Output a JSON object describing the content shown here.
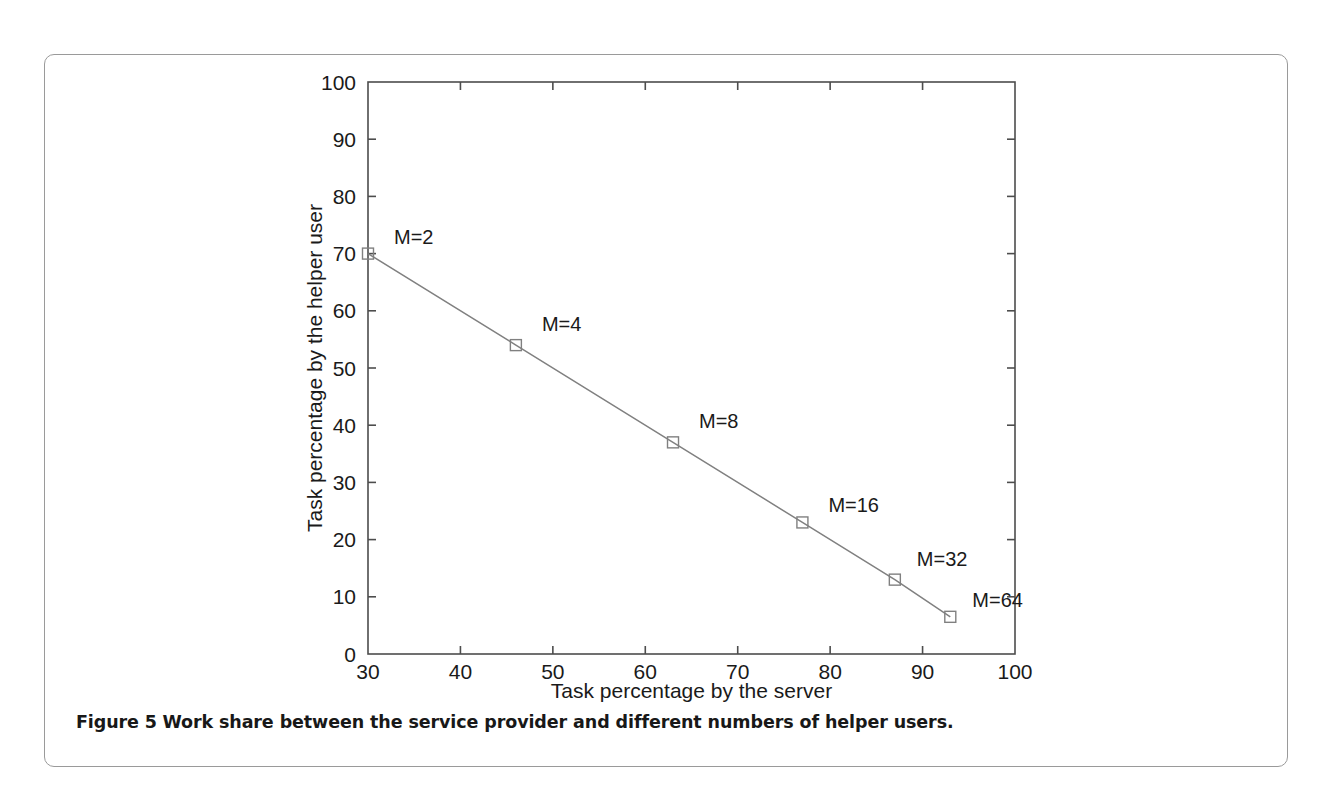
{
  "figure": {
    "caption_label": "Figure 5",
    "caption_text": "Work share between the service provider and different numbers of helper users."
  },
  "chart_data": {
    "type": "line",
    "title": "",
    "xlabel": "Task percentage by the server",
    "ylabel": "Task percentage by the helper user",
    "xlim": [
      30,
      100
    ],
    "ylim": [
      0,
      100
    ],
    "xticks": [
      30,
      40,
      50,
      60,
      70,
      80,
      90,
      100
    ],
    "yticks": [
      0,
      10,
      20,
      30,
      40,
      50,
      60,
      70,
      80,
      90,
      100
    ],
    "xtick_labels": [
      "30",
      "40",
      "50",
      "60",
      "70",
      "80",
      "90",
      "100"
    ],
    "ytick_labels": [
      "0",
      "10",
      "20",
      "30",
      "40",
      "50",
      "60",
      "70",
      "80",
      "90",
      "100"
    ],
    "grid": false,
    "legend": "none",
    "marker": "square-open",
    "line_color": "#808080",
    "marker_color": "#808080",
    "axis_color": "#4d4d4d",
    "series": [
      {
        "name": "helper-user-share",
        "x": [
          30,
          46,
          63,
          77,
          87,
          93
        ],
        "y": [
          70,
          54,
          37,
          23,
          13,
          6.5
        ],
        "point_labels": [
          "M=2",
          "M=4",
          "M=8",
          "M=16",
          "M=32",
          "M=64"
        ]
      }
    ],
    "annotations": [
      {
        "text": "M=2",
        "x": 30,
        "y": 70,
        "dx": 26,
        "dy": -10
      },
      {
        "text": "M=4",
        "x": 46,
        "y": 54,
        "dx": 26,
        "dy": -14
      },
      {
        "text": "M=8",
        "x": 63,
        "y": 37,
        "dx": 26,
        "dy": -14
      },
      {
        "text": "M=16",
        "x": 77,
        "y": 23,
        "dx": 26,
        "dy": -10
      },
      {
        "text": "M=32",
        "x": 87,
        "y": 13,
        "dx": 22,
        "dy": -14
      },
      {
        "text": "M=64",
        "x": 93,
        "y": 6.5,
        "dx": 22,
        "dy": -10
      }
    ]
  }
}
